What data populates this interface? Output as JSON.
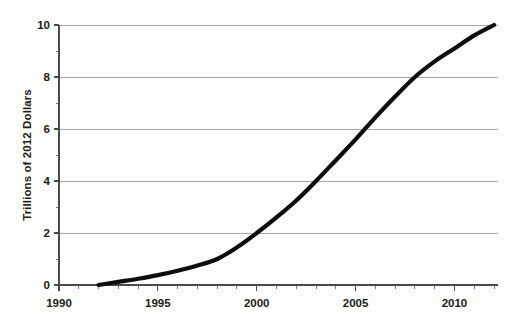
{
  "chart_data": {
    "type": "line",
    "title": "",
    "subtitle": "",
    "xlabel": "",
    "ylabel": "Trillions of 2012 Dollars",
    "xlim": [
      1990,
      2012.2
    ],
    "ylim": [
      0,
      10
    ],
    "grid": true,
    "legend": false,
    "legend_position": "none",
    "y_ticks_major": [
      "0",
      "2",
      "4",
      "6",
      "8",
      "10"
    ],
    "y_tick_values": [
      0,
      2,
      4,
      6,
      8,
      10
    ],
    "y_minor_tick_values": [
      1,
      3,
      5,
      7,
      9
    ],
    "x_ticks_major": [
      "1990",
      "1995",
      "2000",
      "2005",
      "2010"
    ],
    "x_tick_values": [
      1990,
      1995,
      2000,
      2005,
      2010
    ],
    "x_minor_tick_values": [
      1991,
      1992,
      1993,
      1994,
      1996,
      1997,
      1998,
      1999,
      2001,
      2002,
      2003,
      2004,
      2006,
      2007,
      2008,
      2009,
      2011,
      2012
    ],
    "series": [
      {
        "name": "value",
        "color": "#0d0d0d",
        "x": [
          1992,
          1993,
          1994,
          1995,
          1996,
          1997,
          1998,
          1999,
          2000,
          2001,
          2002,
          2003,
          2004,
          2005,
          2006,
          2007,
          2008,
          2009,
          2010,
          2011,
          2012
        ],
        "values": [
          0.0,
          0.12,
          0.24,
          0.38,
          0.55,
          0.75,
          1.0,
          1.45,
          2.0,
          2.6,
          3.25,
          4.0,
          4.8,
          5.6,
          6.45,
          7.25,
          8.0,
          8.6,
          9.1,
          9.6,
          10.0
        ]
      }
    ]
  },
  "colors": {
    "line": "#0d0d0d",
    "grid": "#9a9a9a",
    "axis": "#4a4a4a",
    "text": "#1a1a1a",
    "background": "#fdfdfc"
  }
}
